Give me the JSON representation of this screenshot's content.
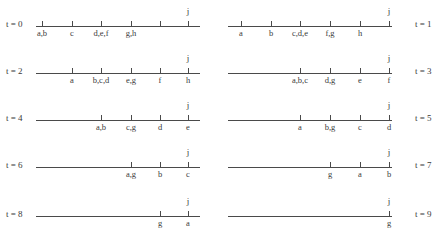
{
  "figure": {
    "type": "timeline-number-lines",
    "marker_above": "j",
    "axis_color": "#4a4a4a",
    "text_color": "#3a3a3a",
    "background": "#ffffff"
  },
  "panels": [
    {
      "id": "t0",
      "t_label": "t = 0",
      "label_side": "left",
      "line": {
        "x1": 36,
        "x2": 200
      },
      "ticks": [
        {
          "x": 42,
          "label": "a,b"
        },
        {
          "x": 72,
          "label": "c"
        },
        {
          "x": 101,
          "label": "d,e,f"
        },
        {
          "x": 131,
          "label": "g,h"
        },
        {
          "x": 160,
          "label": ""
        },
        {
          "x": 188,
          "label": ""
        }
      ],
      "j_x": 188
    },
    {
      "id": "t1",
      "t_label": "t = 1",
      "label_side": "right",
      "line": {
        "x1": 9,
        "x2": 173
      },
      "ticks": [
        {
          "x": 22,
          "label": "a"
        },
        {
          "x": 52,
          "label": "b"
        },
        {
          "x": 81,
          "label": "c,d,e"
        },
        {
          "x": 111,
          "label": "f,g"
        },
        {
          "x": 141,
          "label": "h"
        },
        {
          "x": 170,
          "label": ""
        }
      ],
      "j_x": 170
    },
    {
      "id": "t2",
      "t_label": "t = 2",
      "label_side": "left",
      "line": {
        "x1": 36,
        "x2": 200
      },
      "ticks": [
        {
          "x": 72,
          "label": "a"
        },
        {
          "x": 101,
          "label": "b,c,d"
        },
        {
          "x": 131,
          "label": "e,g"
        },
        {
          "x": 160,
          "label": "f"
        },
        {
          "x": 188,
          "label": "h"
        }
      ],
      "j_x": 188
    },
    {
      "id": "t3",
      "t_label": "t = 3",
      "label_side": "right",
      "line": {
        "x1": 9,
        "x2": 173
      },
      "ticks": [
        {
          "x": 81,
          "label": "a,b,c"
        },
        {
          "x": 111,
          "label": "d,g"
        },
        {
          "x": 141,
          "label": "e"
        },
        {
          "x": 170,
          "label": "f"
        }
      ],
      "j_x": 170
    },
    {
      "id": "t4",
      "t_label": "t = 4",
      "label_side": "left",
      "line": {
        "x1": 36,
        "x2": 200
      },
      "ticks": [
        {
          "x": 101,
          "label": "a,b"
        },
        {
          "x": 131,
          "label": "c,g"
        },
        {
          "x": 160,
          "label": "d"
        },
        {
          "x": 188,
          "label": "e"
        }
      ],
      "j_x": 188
    },
    {
      "id": "t5",
      "t_label": "t = 5",
      "label_side": "right",
      "line": {
        "x1": 9,
        "x2": 173
      },
      "ticks": [
        {
          "x": 81,
          "label": "a"
        },
        {
          "x": 111,
          "label": "b,g"
        },
        {
          "x": 141,
          "label": "c"
        },
        {
          "x": 170,
          "label": "d"
        }
      ],
      "j_x": 170
    },
    {
      "id": "t6",
      "t_label": "t = 6",
      "label_side": "left",
      "line": {
        "x1": 36,
        "x2": 200
      },
      "ticks": [
        {
          "x": 131,
          "label": "a,g"
        },
        {
          "x": 160,
          "label": "b"
        },
        {
          "x": 188,
          "label": "c"
        }
      ],
      "j_x": 188
    },
    {
      "id": "t7",
      "t_label": "t = 7",
      "label_side": "right",
      "line": {
        "x1": 9,
        "x2": 173
      },
      "ticks": [
        {
          "x": 111,
          "label": "g"
        },
        {
          "x": 141,
          "label": "a"
        },
        {
          "x": 170,
          "label": "b"
        }
      ],
      "j_x": 170
    },
    {
      "id": "t8",
      "t_label": "t = 8",
      "label_side": "left",
      "line": {
        "x1": 36,
        "x2": 200
      },
      "ticks": [
        {
          "x": 160,
          "label": "g"
        },
        {
          "x": 188,
          "label": "a"
        }
      ],
      "j_x": 188
    },
    {
      "id": "t9",
      "t_label": "t = 9",
      "label_side": "right",
      "line": {
        "x1": 9,
        "x2": 173
      },
      "ticks": [
        {
          "x": 170,
          "label": "g"
        }
      ],
      "j_x": 170
    }
  ]
}
